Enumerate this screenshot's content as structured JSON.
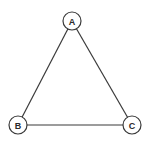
{
  "diagram": {
    "type": "graph",
    "nodes": [
      {
        "id": "A",
        "label": "A",
        "x": 72,
        "y": 21,
        "r": 9
      },
      {
        "id": "B",
        "label": "B",
        "x": 18,
        "y": 125,
        "r": 9
      },
      {
        "id": "C",
        "label": "C",
        "x": 132,
        "y": 125,
        "r": 9
      }
    ],
    "edges": [
      {
        "from": "A",
        "to": "B"
      },
      {
        "from": "A",
        "to": "C"
      },
      {
        "from": "B",
        "to": "C"
      }
    ],
    "colors": {
      "stroke": "#3a3a3a",
      "background": "#ffffff",
      "text": "#2a2a2a"
    }
  }
}
